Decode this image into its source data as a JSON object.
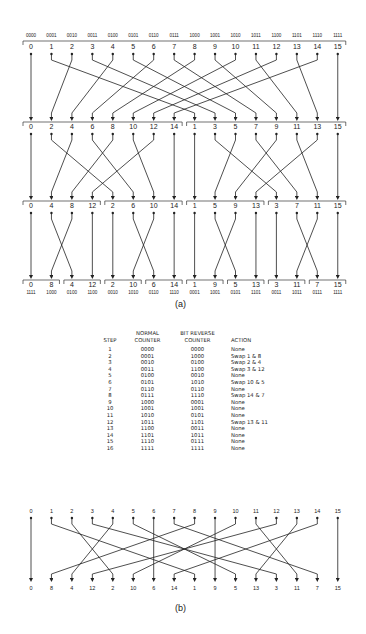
{
  "figure_a": {
    "caption": "(a)",
    "top_binary_labels": [
      "0000",
      "0001",
      "0010",
      "0011",
      "0100",
      "0101",
      "0110",
      "0111",
      "1000",
      "1001",
      "1010",
      "1011",
      "1100",
      "1101",
      "1110",
      "1111"
    ],
    "stage0_order": [
      0,
      1,
      2,
      3,
      4,
      5,
      6,
      7,
      8,
      9,
      10,
      11,
      12,
      13,
      14,
      15
    ],
    "stage1_order": [
      0,
      2,
      4,
      6,
      8,
      10,
      12,
      14,
      1,
      3,
      5,
      7,
      9,
      11,
      13,
      15
    ],
    "stage2_order": [
      0,
      4,
      8,
      12,
      2,
      6,
      10,
      14,
      1,
      5,
      9,
      13,
      3,
      7,
      11,
      15
    ],
    "stage3_order": [
      0,
      8,
      4,
      12,
      2,
      10,
      6,
      14,
      1,
      9,
      5,
      13,
      3,
      11,
      7,
      15
    ],
    "stage1_groups": [
      [
        0,
        7
      ],
      [
        8,
        15
      ]
    ],
    "stage2_groups": [
      [
        0,
        3
      ],
      [
        4,
        7
      ],
      [
        8,
        11
      ],
      [
        12,
        15
      ]
    ],
    "stage3_groups": [
      [
        0,
        1
      ],
      [
        2,
        3
      ],
      [
        4,
        5
      ],
      [
        6,
        7
      ],
      [
        8,
        9
      ],
      [
        10,
        11
      ],
      [
        12,
        13
      ],
      [
        14,
        15
      ]
    ],
    "bottom_binary_labels": [
      "1111",
      "1000",
      "0100",
      "1100",
      "0010",
      "1010",
      "0110",
      "1110",
      "0001",
      "1001",
      "0101",
      "1101",
      "0011",
      "1011",
      "0111",
      "1111"
    ]
  },
  "table": {
    "headers": {
      "step": "STEP",
      "normal_line1": "NORMAL",
      "normal_line2": "COUNTER",
      "reverse_line1": "BIT REVERSE",
      "reverse_line2": "COUNTER",
      "action": "ACTION"
    },
    "rows": [
      {
        "step": "1",
        "normal": "0000",
        "reverse": "0000",
        "action": "None"
      },
      {
        "step": "2",
        "normal": "0001",
        "reverse": "1000",
        "action": "Swap 1 &  8"
      },
      {
        "step": "3",
        "normal": "0010",
        "reverse": "0100",
        "action": "Swap 2 &  4"
      },
      {
        "step": "4",
        "normal": "0011",
        "reverse": "1100",
        "action": "Swap 3 & 12"
      },
      {
        "step": "5",
        "normal": "0100",
        "reverse": "0010",
        "action": "None"
      },
      {
        "step": "6",
        "normal": "0101",
        "reverse": "1010",
        "action": "Swap 10 &  5"
      },
      {
        "step": "7",
        "normal": "0110",
        "reverse": "0110",
        "action": "None"
      },
      {
        "step": "8",
        "normal": "0111",
        "reverse": "1110",
        "action": "Swap 14 &  7"
      },
      {
        "step": "9",
        "normal": "1000",
        "reverse": "0001",
        "action": "None"
      },
      {
        "step": "10",
        "normal": "1001",
        "reverse": "1001",
        "action": "None"
      },
      {
        "step": "11",
        "normal": "1010",
        "reverse": "0101",
        "action": "None"
      },
      {
        "step": "12",
        "normal": "1011",
        "reverse": "1101",
        "action": "Swap 13 & 11"
      },
      {
        "step": "13",
        "normal": "1100",
        "reverse": "0011",
        "action": "None"
      },
      {
        "step": "14",
        "normal": "1101",
        "reverse": "1011",
        "action": "None"
      },
      {
        "step": "15",
        "normal": "1110",
        "reverse": "0111",
        "action": "None"
      },
      {
        "step": "16",
        "normal": "1111",
        "reverse": "1111",
        "action": "None"
      }
    ]
  },
  "figure_b": {
    "caption": "(b)",
    "top_labels": [
      0,
      1,
      2,
      3,
      4,
      5,
      6,
      7,
      8,
      9,
      10,
      11,
      12,
      13,
      14,
      15
    ],
    "bottom_labels": [
      0,
      8,
      4,
      12,
      2,
      10,
      6,
      14,
      1,
      9,
      5,
      13,
      3,
      11,
      7,
      15
    ]
  }
}
